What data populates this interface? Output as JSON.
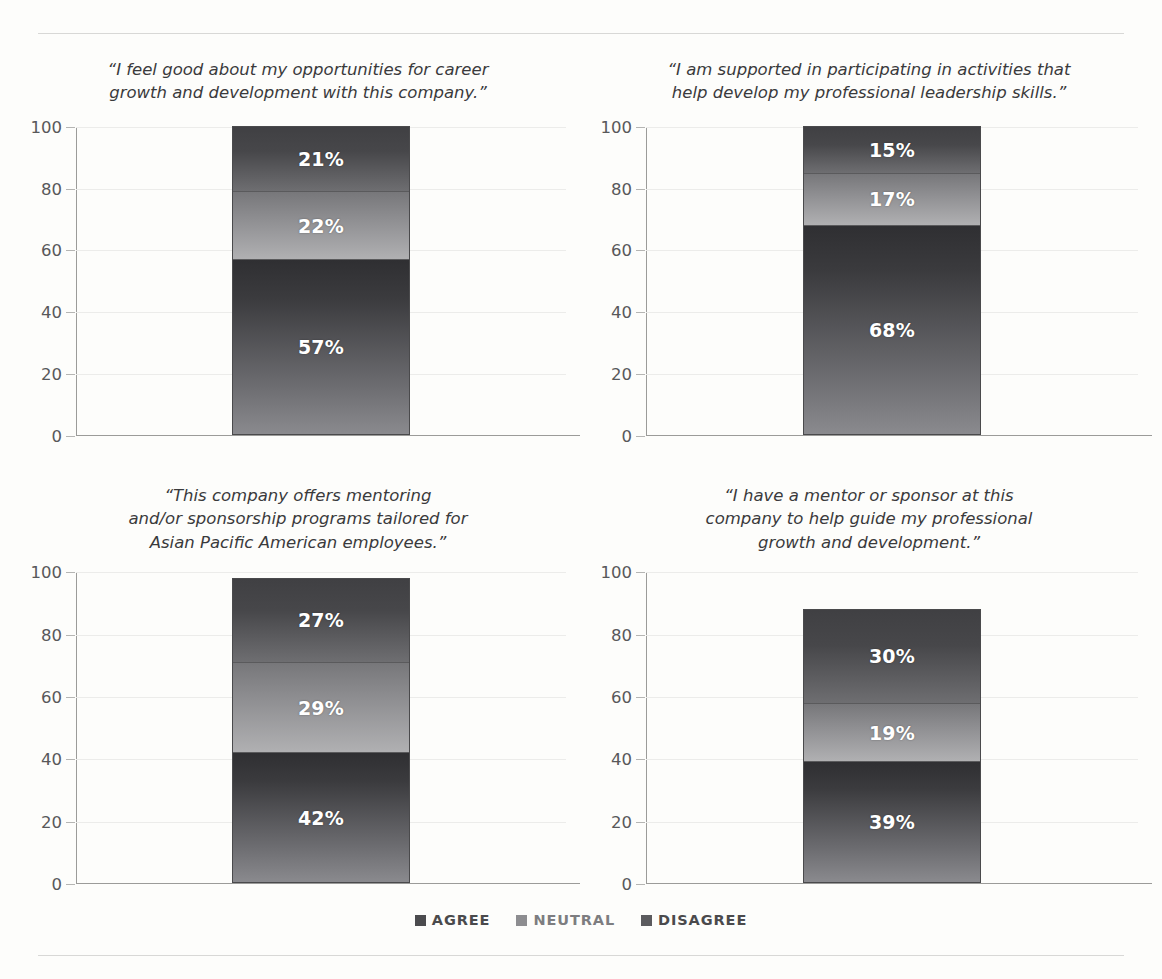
{
  "chart_data": [
    {
      "type": "bar",
      "title": "“I feel good about my opportunities for career growth and development with this company.”",
      "categories": [
        "Agree",
        "Neutral",
        "Disagree"
      ],
      "values": [
        57,
        22,
        21
      ],
      "labels": [
        "57%",
        "22%",
        "21%"
      ],
      "xlabel": "",
      "ylabel": "",
      "ylim": [
        0,
        100
      ],
      "yticks": [
        0,
        20,
        40,
        60,
        80,
        100
      ],
      "stacked": true,
      "grid": true,
      "total": 100
    },
    {
      "type": "bar",
      "title": "“I am supported in participating in activities that help develop my professional leadership skills.”",
      "categories": [
        "Agree",
        "Neutral",
        "Disagree"
      ],
      "values": [
        68,
        17,
        15
      ],
      "labels": [
        "68%",
        "17%",
        "15%"
      ],
      "xlabel": "",
      "ylabel": "",
      "ylim": [
        0,
        100
      ],
      "yticks": [
        0,
        20,
        40,
        60,
        80,
        100
      ],
      "stacked": true,
      "grid": true,
      "total": 100
    },
    {
      "type": "bar",
      "title": "“This company offers mentoring and/or sponsorship programs tailored for Asian Pacific American employees.”",
      "categories": [
        "Agree",
        "Neutral",
        "Disagree"
      ],
      "values": [
        42,
        29,
        27
      ],
      "labels": [
        "42%",
        "29%",
        "27%"
      ],
      "xlabel": "",
      "ylabel": "",
      "ylim": [
        0,
        100
      ],
      "yticks": [
        0,
        20,
        40,
        60,
        80,
        100
      ],
      "stacked": true,
      "grid": true,
      "total": 98
    },
    {
      "type": "bar",
      "title": "“I have a mentor or sponsor at this company to help guide my professional growth and development.”",
      "categories": [
        "Agree",
        "Neutral",
        "Disagree"
      ],
      "values": [
        39,
        19,
        30
      ],
      "labels": [
        "39%",
        "19%",
        "30%"
      ],
      "xlabel": "",
      "ylabel": "",
      "ylim": [
        0,
        100
      ],
      "yticks": [
        0,
        20,
        40,
        60,
        80,
        100
      ],
      "stacked": true,
      "grid": true,
      "total": 88
    }
  ],
  "panels": [
    {
      "quote_lines": [
        "“I feel good about my opportunities for career",
        "growth and development with this company.”"
      ],
      "values": {
        "disagree": "21%",
        "neutral": "22%",
        "agree": "57%"
      },
      "pct": {
        "disagree": 21,
        "neutral": 22,
        "agree": 57
      }
    },
    {
      "quote_lines": [
        "“I am supported in participating in activities that",
        "help develop my professional leadership skills.”"
      ],
      "values": {
        "disagree": "15%",
        "neutral": "17%",
        "agree": "68%"
      },
      "pct": {
        "disagree": 15,
        "neutral": 17,
        "agree": 68
      }
    },
    {
      "quote_lines": [
        "“This company offers mentoring",
        "and/or sponsorship programs tailored for",
        "Asian Pacific American employees.”"
      ],
      "values": {
        "disagree": "27%",
        "neutral": "29%",
        "agree": "42%"
      },
      "pct": {
        "disagree": 27,
        "neutral": 29,
        "agree": 42
      }
    },
    {
      "quote_lines": [
        "“I have a mentor or sponsor at this",
        "company to help guide my professional",
        "growth and development.”"
      ],
      "values": {
        "disagree": "30%",
        "neutral": "19%",
        "agree": "39%"
      },
      "pct": {
        "disagree": 30,
        "neutral": 19,
        "agree": 39
      }
    }
  ],
  "axis": {
    "ticks": [
      "100",
      "80",
      "60",
      "40",
      "20",
      "0"
    ],
    "tick_values": [
      100,
      80,
      60,
      40,
      20,
      0
    ],
    "max": 100
  },
  "legend": {
    "items": [
      {
        "label": "AGREE",
        "color": "#4b4b4e"
      },
      {
        "label": "NEUTRAL",
        "color": "#8d8d90"
      },
      {
        "label": "DISAGREE",
        "color": "#5b5b5e"
      }
    ]
  },
  "colors": {
    "agree": "#3b3b3e",
    "neutral": "#8d8d90",
    "disagree": "#47474a",
    "rule": "#d8d8d6",
    "axis": "#9b9b99",
    "grid": "#ececea",
    "background": "#fdfdfb",
    "label_text": "#ffffff",
    "quote_text": "#3a3a3c"
  }
}
